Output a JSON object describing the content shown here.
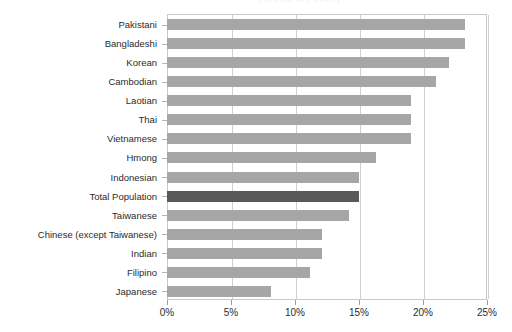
{
  "chart_data": {
    "type": "bar",
    "orientation": "horizontal",
    "title": "Percent in Poverty",
    "xlabel": "",
    "ylabel": "",
    "xlim": [
      0,
      25
    ],
    "xticks": [
      0,
      5,
      10,
      15,
      20,
      25
    ],
    "xtick_labels": [
      "0%",
      "5%",
      "10%",
      "15%",
      "20%",
      "25%"
    ],
    "grid": true,
    "grid_axis": "x",
    "legend": "none",
    "unit": "%",
    "colors": {
      "bar": "#a6a6a6",
      "highlight_bar": "#595959",
      "gridline": "#cfcfcf",
      "axis": "#c8c8c8",
      "text": "#2b2b2b",
      "background": "#ffffff"
    },
    "highlight_category": "Total Population",
    "categories": [
      "Pakistani",
      "Bangladeshi",
      "Korean",
      "Cambodian",
      "Laotian",
      "Thai",
      "Vietnamese",
      "Hmong",
      "Indonesian",
      "Total Population",
      "Taiwanese",
      "Chinese (except Taiwanese)",
      "Indian",
      "Filipino",
      "Japanese"
    ],
    "values": [
      23.3,
      23.3,
      22.0,
      21.0,
      19.1,
      19.1,
      19.1,
      16.3,
      15.0,
      15.0,
      14.2,
      12.1,
      12.1,
      11.2,
      8.1
    ]
  }
}
